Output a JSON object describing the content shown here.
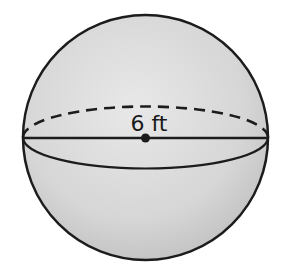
{
  "figure": {
    "shape": "sphere",
    "radius_label": "6 ft",
    "colors": {
      "outline": "#1c1c1c",
      "fill_light": "#e6e6e6",
      "fill_dark": "#bdbdbd",
      "background": "#ffffff"
    }
  }
}
